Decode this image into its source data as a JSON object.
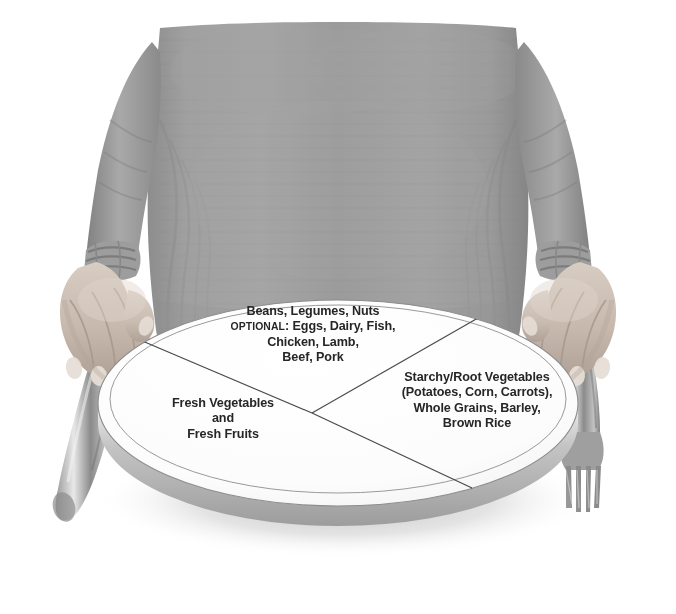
{
  "image": {
    "title": "Healthy Eating Plate",
    "description": "Photograph of a person in a gray long-sleeve shirt standing behind a white round plate, hands resting on the table beside a knife on the left and a fork on the right. The plate is divided into three labeled wedges.",
    "background_color": "#ffffff"
  },
  "colors": {
    "shirt_gray": "#9a9a9a",
    "shirt_shadow": "#7e7e7e",
    "skin": "#cfc2b6",
    "skin_shadow": "#a2958a",
    "plate_face": "#fdfdfd",
    "plate_side": "#a8a8a8",
    "plate_line": "#4a4a4a",
    "plate_shadow": "#c9c9c9",
    "cutlery": "#9c9c9c",
    "cutlery_highlight": "#e2e2e2",
    "text": "#262626"
  },
  "plate": {
    "name": "divided-meal-plate",
    "sections": [
      {
        "id": "protein",
        "name": "protein-section",
        "position": "top",
        "lines": [
          {
            "text": "Beans, Legumes, Nuts",
            "style": "normal"
          },
          {
            "text_prefix": "OPTIONAL",
            "text_suffix": ": Eggs, Dairy, Fish,",
            "style": "smallcaps-prefix"
          },
          {
            "text": "Chicken, Lamb,",
            "style": "normal"
          },
          {
            "text": "Beef, Pork",
            "style": "normal"
          }
        ]
      },
      {
        "id": "produce",
        "name": "vegetables-fruits-section",
        "position": "left",
        "lines": [
          {
            "text": "Fresh Vegetables",
            "style": "normal"
          },
          {
            "text": "and",
            "style": "normal"
          },
          {
            "text": "Fresh Fruits",
            "style": "normal"
          }
        ]
      },
      {
        "id": "starch",
        "name": "starches-grains-section",
        "position": "right",
        "lines": [
          {
            "text": "Starchy/Root Vegetables",
            "style": "normal"
          },
          {
            "text": "(Potatoes, Corn, Carrots),",
            "style": "normal"
          },
          {
            "text": "Whole Grains, Barley,",
            "style": "normal"
          },
          {
            "text": "Brown Rice",
            "style": "normal"
          }
        ]
      }
    ]
  },
  "objects": [
    {
      "name": "person-torso",
      "label": "Person in gray shirt"
    },
    {
      "name": "left-hand",
      "label": "Left hand on table"
    },
    {
      "name": "right-hand",
      "label": "Right hand on table"
    },
    {
      "name": "knife",
      "label": "Table knife"
    },
    {
      "name": "fork",
      "label": "Table fork"
    }
  ]
}
